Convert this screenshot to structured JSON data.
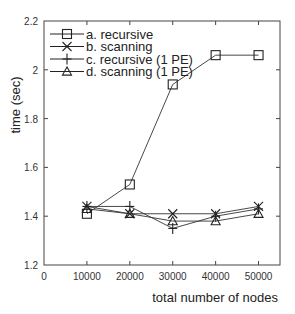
{
  "chart_data": {
    "type": "line",
    "title": "",
    "xlabel": "total number of nodes",
    "ylabel": "time (sec)",
    "xlim": [
      0,
      55000
    ],
    "ylim": [
      1.2,
      2.2
    ],
    "xticks": [
      0,
      10000,
      20000,
      30000,
      40000,
      50000
    ],
    "yticks": [
      1.2,
      1.4,
      1.6,
      1.8,
      2,
      2.2
    ],
    "xtick_labels": [
      "0",
      "10000",
      "20000",
      "30000",
      "40000",
      "50000"
    ],
    "ytick_labels": [
      "1.2",
      "1.4",
      "1.6",
      "1.8",
      "2",
      "2.2"
    ],
    "grid": false,
    "legend_position": "upper left",
    "x": [
      10000,
      20000,
      30000,
      40000,
      50000
    ],
    "series": [
      {
        "name": "a. recursive",
        "marker": "square",
        "values": [
          1.41,
          1.53,
          1.94,
          2.06,
          2.06
        ]
      },
      {
        "name": "b. scanning",
        "marker": "x",
        "values": [
          1.44,
          1.41,
          1.41,
          1.41,
          1.44
        ]
      },
      {
        "name": "c. recursive (1 PE)",
        "marker": "plus",
        "values": [
          1.44,
          1.44,
          1.35,
          1.4,
          1.43
        ]
      },
      {
        "name": "d. scanning (1 PE)",
        "marker": "triangle",
        "values": [
          1.43,
          1.41,
          1.38,
          1.38,
          1.41
        ]
      }
    ]
  }
}
